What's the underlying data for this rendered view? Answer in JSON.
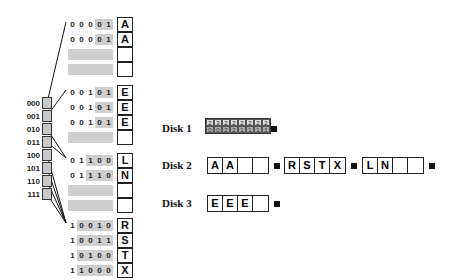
{
  "directory": {
    "labels": [
      "000",
      "001",
      "010",
      "011",
      "100",
      "101",
      "110",
      "111"
    ]
  },
  "buckets": [
    {
      "rows": [
        {
          "bits": [
            "0",
            "0",
            "0",
            "0",
            "1"
          ],
          "gray_from": 3,
          "key": "A"
        },
        {
          "bits": [
            "0",
            "0",
            "0",
            "0",
            "1"
          ],
          "gray_from": 3,
          "key": "A"
        },
        {
          "bits": null,
          "key": ""
        },
        {
          "bits": null,
          "key": ""
        }
      ]
    },
    {
      "rows": [
        {
          "bits": [
            "0",
            "0",
            "1",
            "0",
            "1"
          ],
          "gray_from": 3,
          "key": "E"
        },
        {
          "bits": [
            "0",
            "0",
            "1",
            "0",
            "1"
          ],
          "gray_from": 3,
          "key": "E"
        },
        {
          "bits": [
            "0",
            "0",
            "1",
            "0",
            "1"
          ],
          "gray_from": 3,
          "key": "E"
        },
        {
          "bits": null,
          "key": ""
        }
      ]
    },
    {
      "rows": [
        {
          "bits": [
            "0",
            "1",
            "1",
            "0",
            "0"
          ],
          "gray_from": 2,
          "key": "L"
        },
        {
          "bits": [
            "0",
            "1",
            "1",
            "1",
            "0"
          ],
          "gray_from": 2,
          "key": "N"
        },
        {
          "bits": null,
          "key": ""
        },
        {
          "bits": null,
          "key": ""
        }
      ]
    },
    {
      "rows": [
        {
          "bits": [
            "1",
            "0",
            "0",
            "1",
            "0"
          ],
          "gray_from": 1,
          "key": "R"
        },
        {
          "bits": [
            "1",
            "0",
            "0",
            "1",
            "1"
          ],
          "gray_from": 1,
          "key": "S"
        },
        {
          "bits": [
            "1",
            "0",
            "1",
            "0",
            "0"
          ],
          "gray_from": 1,
          "key": "T"
        },
        {
          "bits": [
            "1",
            "1",
            "0",
            "0",
            "0"
          ],
          "gray_from": 1,
          "key": "X"
        }
      ]
    }
  ],
  "disks": [
    {
      "label": "Disk 1",
      "directory_top": [
        "2",
        "3",
        "2",
        "2",
        "2",
        "2",
        "2",
        "2"
      ],
      "directory_bottom": [
        "0",
        "0",
        "2",
        "2",
        "1",
        "1",
        "1",
        "1"
      ]
    },
    {
      "label": "Disk 2",
      "blocks": [
        [
          "A",
          "A",
          "",
          ""
        ],
        [
          "R",
          "S",
          "T",
          "X"
        ],
        [
          "L",
          "N",
          "",
          ""
        ]
      ]
    },
    {
      "label": "Disk 3",
      "blocks": [
        [
          "E",
          "E",
          "E",
          ""
        ]
      ]
    }
  ],
  "icons": {
    "block_end": "black-square",
    "pointer": "dot-arrow"
  }
}
